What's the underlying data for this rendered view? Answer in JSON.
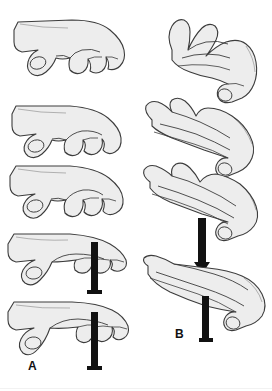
{
  "figure": {
    "background_color": "#ffffff",
    "width": 272,
    "height": 391,
    "line_color": "#3c3c3c",
    "fill_color": "#ededed",
    "arrow_color": "#111111",
    "label_color": "#111111"
  },
  "panels": [
    {
      "id": "A",
      "label": "A",
      "label_x": 28,
      "label_y": 360,
      "description": "Left column: hand viewed from ulnar side showing progressive finger extension from hook fist to straight fingers",
      "steps": [
        {
          "index": 1,
          "name": "hook-fist",
          "x": 12,
          "y": 16,
          "w": 122,
          "h": 72,
          "has_arrow": false
        },
        {
          "index": 2,
          "name": "partial-flexion",
          "x": 8,
          "y": 100,
          "w": 126,
          "h": 70,
          "has_arrow": false
        },
        {
          "index": 3,
          "name": "straight-fist",
          "x": 6,
          "y": 158,
          "w": 128,
          "h": 72,
          "has_arrow": false
        },
        {
          "index": 4,
          "name": "mcp-flexion-with-force",
          "x": 4,
          "y": 228,
          "w": 130,
          "h": 72,
          "has_arrow": true
        },
        {
          "index": 5,
          "name": "tabletop-with-force",
          "x": 4,
          "y": 296,
          "w": 132,
          "h": 76,
          "has_arrow": true
        }
      ],
      "arrows": [
        {
          "name": "downward-force-arrow",
          "direction": "down",
          "x": 88,
          "y": 242,
          "w": 12,
          "h": 52
        },
        {
          "name": "downward-force-arrow",
          "direction": "down",
          "x": 88,
          "y": 312,
          "w": 12,
          "h": 58
        }
      ]
    },
    {
      "id": "B",
      "label": "B",
      "label_x": 175,
      "label_y": 328,
      "description": "Right column: hand viewed from radial side showing progressive finger extension and thumb position with downward force",
      "steps": [
        {
          "index": 1,
          "name": "fingers-flexed-radial-view",
          "x": 146,
          "y": 14,
          "w": 120,
          "h": 92,
          "has_arrow": false
        },
        {
          "index": 2,
          "name": "fingers-extending-radial-view",
          "x": 138,
          "y": 96,
          "w": 128,
          "h": 86,
          "has_arrow": false
        },
        {
          "index": 3,
          "name": "fingers-straight-with-force",
          "x": 140,
          "y": 160,
          "w": 128,
          "h": 86,
          "has_arrow": true
        },
        {
          "index": 4,
          "name": "flat-hand-with-force",
          "x": 140,
          "y": 254,
          "w": 130,
          "h": 80,
          "has_arrow": true
        }
      ],
      "arrows": [
        {
          "name": "downward-force-arrow",
          "direction": "down",
          "x": 196,
          "y": 218,
          "w": 12,
          "h": 52
        },
        {
          "name": "downward-force-arrow",
          "direction": "down",
          "x": 200,
          "y": 296,
          "w": 10,
          "h": 44
        }
      ]
    }
  ]
}
